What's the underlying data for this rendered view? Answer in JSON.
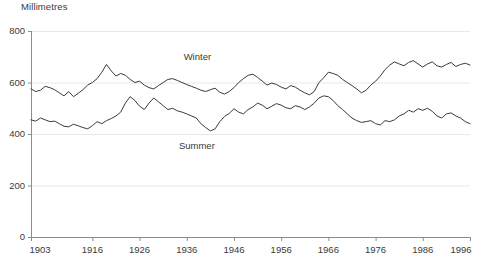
{
  "chart_data": {
    "type": "line",
    "title": "",
    "ylabel": "Millimetres",
    "xlabel": "",
    "ylim": [
      0,
      800
    ],
    "xlim": [
      1903,
      1996
    ],
    "grid": true,
    "grid_axis": "y",
    "legend_position": "inline-annotation",
    "yticks": [
      0,
      200,
      400,
      600,
      800
    ],
    "ytick_labels": [
      "0",
      "200",
      "400",
      "600",
      "800"
    ],
    "xticks": [
      1903,
      1916,
      1926,
      1936,
      1946,
      1956,
      1966,
      1976,
      1986,
      1996
    ],
    "xtick_labels": [
      "1903",
      "1916",
      "1926",
      "1936",
      "1946",
      "1956",
      "1966",
      "1976",
      "1986",
      "1996"
    ],
    "annotations": [
      {
        "text": "Winter",
        "x": 1940,
        "y": 700
      },
      {
        "text": "Summer",
        "x": 1939,
        "y": 355
      }
    ],
    "line_color": "#3a3a3a",
    "axis_color": "#8c8c8c",
    "grid_color": "#e8e8e8",
    "x": [
      1903,
      1904,
      1905,
      1906,
      1907,
      1908,
      1909,
      1910,
      1911,
      1912,
      1913,
      1914,
      1915,
      1916,
      1917,
      1918,
      1919,
      1920,
      1921,
      1922,
      1923,
      1924,
      1925,
      1926,
      1927,
      1928,
      1929,
      1930,
      1931,
      1932,
      1933,
      1934,
      1935,
      1936,
      1937,
      1938,
      1939,
      1940,
      1941,
      1942,
      1943,
      1944,
      1945,
      1946,
      1947,
      1948,
      1949,
      1950,
      1951,
      1952,
      1953,
      1954,
      1955,
      1956,
      1957,
      1958,
      1959,
      1960,
      1961,
      1962,
      1963,
      1964,
      1965,
      1966,
      1967,
      1968,
      1969,
      1970,
      1971,
      1972,
      1973,
      1974,
      1975,
      1976,
      1977,
      1978,
      1979,
      1980,
      1981,
      1982,
      1983,
      1984,
      1985,
      1986,
      1987,
      1988,
      1989,
      1990,
      1991,
      1992,
      1993,
      1994,
      1995,
      1996
    ],
    "series": [
      {
        "name": "Winter",
        "values": [
          575,
          565,
          570,
          585,
          580,
          572,
          560,
          548,
          565,
          545,
          558,
          572,
          590,
          600,
          615,
          640,
          670,
          645,
          625,
          635,
          628,
          612,
          600,
          605,
          590,
          580,
          575,
          588,
          600,
          612,
          615,
          608,
          600,
          592,
          585,
          578,
          570,
          565,
          572,
          578,
          562,
          555,
          565,
          580,
          600,
          615,
          628,
          632,
          620,
          605,
          590,
          598,
          592,
          582,
          575,
          588,
          582,
          570,
          560,
          552,
          565,
          600,
          618,
          640,
          635,
          628,
          612,
          600,
          588,
          575,
          560,
          570,
          590,
          605,
          625,
          650,
          668,
          680,
          672,
          665,
          678,
          685,
          672,
          660,
          672,
          680,
          665,
          660,
          670,
          678,
          662,
          670,
          675,
          668
        ]
      },
      {
        "name": "Summer",
        "values": [
          455,
          450,
          462,
          455,
          448,
          450,
          440,
          430,
          428,
          438,
          432,
          425,
          420,
          432,
          448,
          440,
          452,
          460,
          470,
          485,
          520,
          545,
          530,
          508,
          495,
          520,
          540,
          525,
          510,
          495,
          500,
          490,
          485,
          478,
          470,
          462,
          440,
          425,
          412,
          420,
          448,
          468,
          480,
          498,
          485,
          478,
          495,
          505,
          520,
          512,
          498,
          508,
          518,
          512,
          502,
          498,
          510,
          505,
          495,
          505,
          520,
          540,
          548,
          545,
          530,
          510,
          495,
          478,
          462,
          452,
          445,
          448,
          452,
          440,
          435,
          452,
          448,
          455,
          470,
          478,
          492,
          485,
          498,
          492,
          500,
          488,
          470,
          462,
          478,
          482,
          470,
          462,
          448,
          440
        ]
      }
    ]
  }
}
